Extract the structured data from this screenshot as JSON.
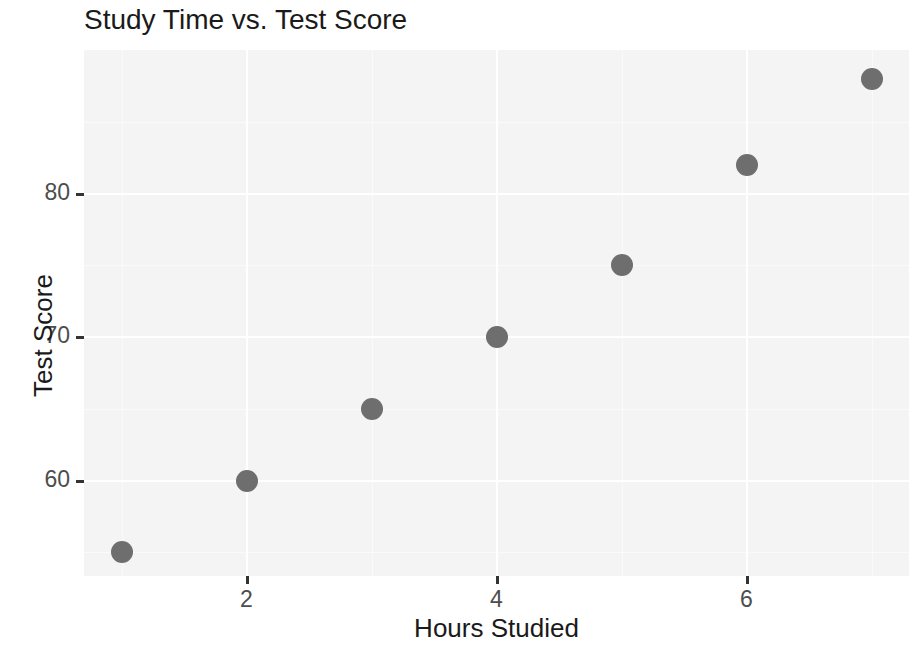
{
  "chart_data": {
    "type": "scatter",
    "title": "Study Time vs. Test Score",
    "xlabel": "Hours Studied",
    "ylabel": "Test Score",
    "x": [
      1,
      2,
      3,
      4,
      5,
      6,
      7
    ],
    "y": [
      55,
      60,
      65,
      70,
      75,
      82,
      88
    ],
    "points": [
      {
        "x": 1,
        "y": 55
      },
      {
        "x": 2,
        "y": 60
      },
      {
        "x": 3,
        "y": 65
      },
      {
        "x": 4,
        "y": 70
      },
      {
        "x": 5,
        "y": 75
      },
      {
        "x": 6,
        "y": 82
      },
      {
        "x": 7,
        "y": 88
      }
    ],
    "xlim": [
      0.7,
      7.3
    ],
    "ylim": [
      53.35,
      90.0
    ],
    "x_ticks": [
      2,
      4,
      6
    ],
    "x_tick_labels": [
      "2",
      "4",
      "6"
    ],
    "y_ticks": [
      60,
      70,
      80
    ],
    "y_tick_labels": [
      "60",
      "70",
      "80"
    ],
    "x_minor_ticks": [
      1,
      3,
      5,
      7
    ],
    "y_minor_ticks": [
      55,
      65,
      75,
      85
    ],
    "grid": true,
    "legend": null,
    "point_color": "#6e6e6e",
    "panel_background": "#f4f4f4",
    "gridline_color": "#ffffff",
    "text_color": "#1a1a1a",
    "tick_label_color": "#4d4d4d"
  }
}
